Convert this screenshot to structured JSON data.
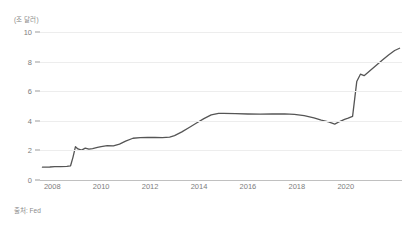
{
  "axis": {
    "y_unit_label": "(조 달러)",
    "source_note": "출처: Fed"
  },
  "chart_data": {
    "type": "line",
    "title": "",
    "subtitle": "",
    "xlabel": "",
    "ylabel": "(조 달러)",
    "unit": "조 달러",
    "source": "출처: Fed",
    "grid": true,
    "legend": null,
    "legend_position": "none",
    "line_color": "#555555",
    "line_width": 1.3,
    "xlim": [
      2007.5,
      2022.3
    ],
    "ylim": [
      0,
      10
    ],
    "yticks": [
      0,
      2,
      4,
      6,
      8,
      10
    ],
    "ytick_labels": [
      "0",
      "2",
      "4",
      "6",
      "8",
      "10"
    ],
    "xticks": [
      2008,
      2010,
      2012,
      2014,
      2016,
      2018,
      2020
    ],
    "xtick_labels": [
      "2008",
      "2010",
      "2012",
      "2014",
      "2016",
      "2018",
      "2020"
    ],
    "series": [
      {
        "name": "Fed 총자산",
        "x": [
          2007.6,
          2007.9,
          2008.1,
          2008.35,
          2008.6,
          2008.75,
          2008.85,
          2008.95,
          2009.05,
          2009.2,
          2009.35,
          2009.5,
          2009.65,
          2009.85,
          2010.0,
          2010.25,
          2010.5,
          2010.75,
          2011.0,
          2011.3,
          2011.6,
          2011.9,
          2012.2,
          2012.5,
          2012.8,
          2013.0,
          2013.3,
          2013.6,
          2013.9,
          2014.2,
          2014.5,
          2014.8,
          2015.0,
          2015.5,
          2016.0,
          2016.5,
          2017.0,
          2017.5,
          2017.9,
          2018.3,
          2018.7,
          2019.0,
          2019.3,
          2019.55,
          2019.75,
          2019.95,
          2020.1,
          2020.2,
          2020.28,
          2020.45,
          2020.6,
          2020.75,
          2021.0,
          2021.25,
          2021.5,
          2021.75,
          2022.0,
          2022.2
        ],
        "y": [
          0.87,
          0.88,
          0.9,
          0.91,
          0.92,
          0.96,
          1.55,
          2.25,
          2.1,
          2.02,
          2.15,
          2.08,
          2.12,
          2.2,
          2.25,
          2.32,
          2.3,
          2.42,
          2.63,
          2.82,
          2.86,
          2.88,
          2.87,
          2.86,
          2.9,
          3.0,
          3.25,
          3.55,
          3.85,
          4.15,
          4.4,
          4.5,
          4.5,
          4.48,
          4.46,
          4.45,
          4.46,
          4.47,
          4.44,
          4.35,
          4.2,
          4.05,
          3.92,
          3.78,
          3.95,
          4.1,
          4.18,
          4.25,
          4.3,
          6.65,
          7.15,
          7.05,
          7.4,
          7.75,
          8.1,
          8.45,
          8.75,
          8.9
        ]
      }
    ]
  }
}
